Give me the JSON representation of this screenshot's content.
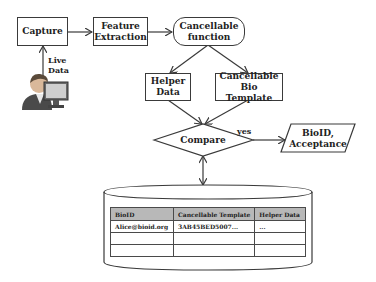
{
  "diagram": {
    "type": "flowchart",
    "nodes": {
      "capture": {
        "label": "Capture"
      },
      "feature_extraction": {
        "line1": "Feature",
        "line2": "Extraction"
      },
      "cancellable_function": {
        "line1": "Cancellable",
        "line2": "function"
      },
      "helper_data": {
        "line1": "Helper",
        "line2": "Data"
      },
      "cancellable_bio_template": {
        "line1": "Cancellable",
        "line2": "Bio Template"
      },
      "compare": {
        "label": "Compare"
      },
      "output": {
        "line1": "BioID,",
        "line2": "Acceptance"
      }
    },
    "edge_labels": {
      "live_data_line1": "Live",
      "live_data_line2": "Data",
      "yes": "yes"
    },
    "database": {
      "columns": [
        "BioID",
        "Cancellable Template",
        "Helper Data"
      ],
      "rows": [
        [
          "Alice@bioid.org",
          "3AB45BED5007...",
          "..."
        ],
        [
          "",
          "",
          ""
        ],
        [
          "",
          "",
          ""
        ]
      ]
    },
    "icons": {
      "user": "user-at-computer-icon"
    },
    "colors": {
      "stroke": "#3a3a3a",
      "table_header_bg": "#b8b8b8",
      "background": "#ffffff"
    }
  }
}
